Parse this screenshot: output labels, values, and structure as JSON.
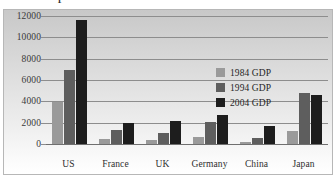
{
  "title": "Comparison of GDP",
  "chart_data": {
    "type": "bar",
    "title": "Comparison of GDP",
    "xlabel": "",
    "ylabel": "",
    "ylim": [
      0,
      12000
    ],
    "yticks": [
      0,
      2000,
      4000,
      6000,
      8000,
      10000,
      12000
    ],
    "ytick_labels": [
      "0",
      "2000",
      "4000",
      "6000",
      "8000",
      "10000",
      "12000"
    ],
    "grid": true,
    "legend_position": "inside-right",
    "categories": [
      "US",
      "France",
      "UK",
      "Germany",
      "China",
      "Japan"
    ],
    "series": [
      {
        "name": "1984 GDP",
        "color": "#9a9a9a",
        "values": [
          3900,
          430,
          380,
          650,
          230,
          1250
        ]
      },
      {
        "name": "1994 GDP",
        "color": "#5e5e5e",
        "values": [
          6950,
          1300,
          1020,
          2030,
          540,
          4800
        ]
      },
      {
        "name": "2004 GDP",
        "color": "#1d1d1d",
        "values": [
          11600,
          1950,
          2120,
          2700,
          1680,
          4620
        ]
      }
    ]
  },
  "colors": {
    "series_1984": "#9a9a9a",
    "series_1994": "#5e5e5e",
    "series_2004": "#1d1d1d",
    "gridline": "#8d8d8d",
    "frame_border": "#b7b7b7",
    "text": "#2e2e2e"
  }
}
